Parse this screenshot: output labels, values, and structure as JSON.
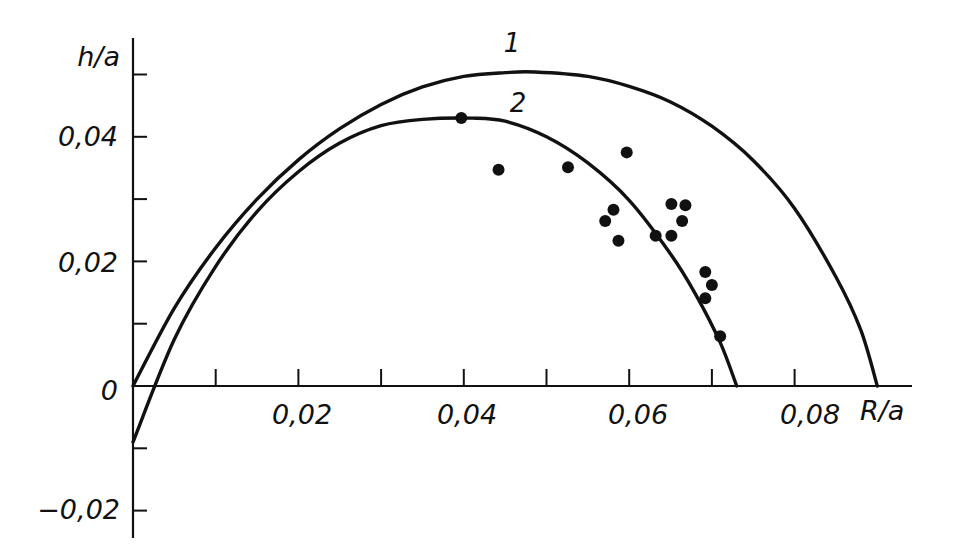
{
  "chart_data": {
    "type": "scatter",
    "title": "",
    "xlabel": "R/a",
    "ylabel": "h/a",
    "xlim": [
      0,
      0.09
    ],
    "ylim": [
      -0.02,
      0.05
    ],
    "grid": false,
    "x_ticks": [
      0.01,
      0.02,
      0.03,
      0.04,
      0.05,
      0.06,
      0.07,
      0.08
    ],
    "x_tick_labels": [
      {
        "value": 0.02,
        "label": "0,02"
      },
      {
        "value": 0.04,
        "label": "0,04"
      },
      {
        "value": 0.06,
        "label": "0,06"
      },
      {
        "value": 0.08,
        "label": "0,08"
      }
    ],
    "y_ticks": [
      -0.02,
      -0.01,
      0,
      0.01,
      0.02,
      0.03,
      0.04,
      0.05
    ],
    "y_tick_labels": [
      {
        "value": 0.04,
        "label": "0,04"
      },
      {
        "value": 0.02,
        "label": "0,02"
      },
      {
        "value": 0,
        "label": "0"
      },
      {
        "value": -0.02,
        "label": "−0,02"
      }
    ],
    "series": [
      {
        "name": "1",
        "kind": "line",
        "x": [
          0,
          0.005,
          0.01,
          0.015,
          0.02,
          0.025,
          0.03,
          0.035,
          0.04,
          0.045,
          0.0486,
          0.055,
          0.06,
          0.065,
          0.07,
          0.075,
          0.08,
          0.085,
          0.088,
          0.09
        ],
        "y": [
          0,
          0.0125,
          0.0222,
          0.03,
          0.0363,
          0.0413,
          0.0452,
          0.048,
          0.0497,
          0.0503,
          0.0504,
          0.0497,
          0.0481,
          0.0456,
          0.0417,
          0.0362,
          0.0285,
          0.0175,
          0.009,
          0
        ]
      },
      {
        "name": "2",
        "kind": "line",
        "x": [
          0,
          0.005,
          0.01,
          0.015,
          0.02,
          0.025,
          0.03,
          0.035,
          0.041,
          0.045,
          0.05,
          0.055,
          0.06,
          0.065,
          0.068,
          0.071,
          0.073
        ],
        "y": [
          -0.009,
          0.0075,
          0.0192,
          0.028,
          0.0344,
          0.039,
          0.0418,
          0.0428,
          0.043,
          0.0425,
          0.04,
          0.0358,
          0.0298,
          0.0212,
          0.0148,
          0.007,
          0
        ]
      },
      {
        "name": "experimental points",
        "kind": "scatter",
        "x": [
          0.0397,
          0.0442,
          0.0526,
          0.0597,
          0.0571,
          0.0581,
          0.0587,
          0.0632,
          0.0651,
          0.0651,
          0.0668,
          0.0664,
          0.0692,
          0.07,
          0.0692,
          0.071
        ],
        "y": [
          0.043,
          0.0347,
          0.0351,
          0.0375,
          0.0265,
          0.0283,
          0.0233,
          0.0241,
          0.0241,
          0.0292,
          0.029,
          0.0265,
          0.0183,
          0.0162,
          0.0141,
          0.008
        ]
      }
    ],
    "annotations": [
      {
        "text": "1",
        "x": 0.0455,
        "y": 0.0545,
        "refers_to": "curve 1"
      },
      {
        "text": "2",
        "x": 0.0465,
        "y": 0.044,
        "refers_to": "curve 2"
      }
    ],
    "legend": "none (curves labeled inline)"
  },
  "labels": {
    "ylabel": "h/a",
    "xlabel": "R/a",
    "curve1": "1",
    "curve2": "2",
    "xt_002": "0,02",
    "xt_004": "0,04",
    "xt_006": "0,06",
    "xt_008": "0,08",
    "yt_004": "0,04",
    "yt_002": "0,02",
    "yt_0": "0",
    "yt_m002": "−0,02"
  },
  "colors": {
    "ink": "#111111",
    "background": "#ffffff"
  }
}
